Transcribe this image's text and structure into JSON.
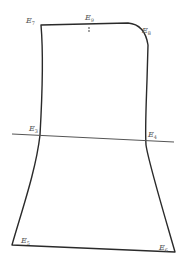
{
  "diagram": {
    "type": "outline-shape",
    "stroke_color": "#2a2a2a",
    "labels": [
      {
        "id": "E7",
        "base": "E",
        "sub": "7"
      },
      {
        "id": "E9",
        "base": "E",
        "sub": "9"
      },
      {
        "id": "E8",
        "base": "E",
        "sub": "8"
      },
      {
        "id": "E3",
        "base": "E",
        "sub": "3"
      },
      {
        "id": "E4",
        "base": "E",
        "sub": "4"
      },
      {
        "id": "E5",
        "base": "E",
        "sub": "5"
      },
      {
        "id": "E6",
        "base": "E",
        "sub": "6"
      }
    ],
    "reference_line": {
      "from": "E3",
      "to": "E4"
    }
  }
}
